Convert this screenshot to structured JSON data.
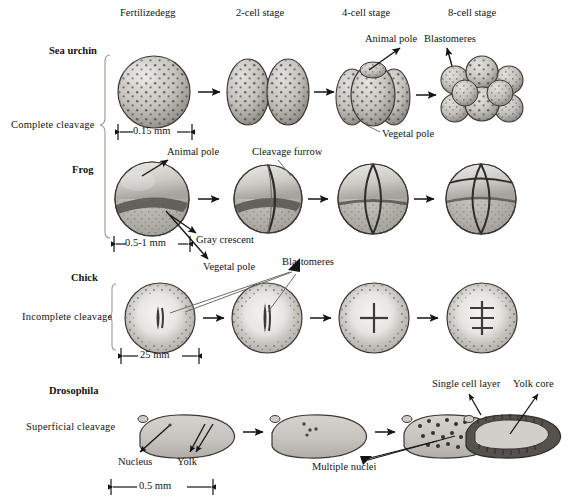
{
  "figure": {
    "columns": [
      {
        "label": "Fertilizedegg",
        "x": 120,
        "y": 14
      },
      {
        "label": "2-cell stage",
        "x": 236,
        "y": 14
      },
      {
        "label": "4-cell stage",
        "x": 342,
        "y": 14
      },
      {
        "label": "8-cell stage",
        "x": 448,
        "y": 14
      }
    ],
    "rows": [
      {
        "name": "Sea urchin",
        "name_x": 100,
        "name_y": 52,
        "cleavage": "Complete cleavage",
        "cleavage_x": 92,
        "cleavage_y": 126
      },
      {
        "name": "Frog",
        "name_x": 100,
        "name_y": 170,
        "cleavage": "",
        "cleavage_x": 0,
        "cleavage_y": 0
      },
      {
        "name": "Chick",
        "name_x": 100,
        "name_y": 278,
        "cleavage": "Incomplete cleavage",
        "cleavage_x": 100,
        "cleavage_y": 316
      },
      {
        "name": "Drosophila",
        "name_x": 100,
        "name_y": 391,
        "cleavage": "Superficial cleavage",
        "cleavage_x": 100,
        "cleavage_y": 427
      }
    ],
    "annotations": [
      {
        "text": "Animal pole",
        "x": 365,
        "y": 40,
        "name": "annotation-animal-pole-urchin"
      },
      {
        "text": "Blastomeres",
        "x": 425,
        "y": 40,
        "name": "annotation-blastomeres-urchin"
      },
      {
        "text": "Vegetal pole",
        "x": 369,
        "y": 135,
        "name": "annotation-vegetal-pole-urchin"
      },
      {
        "text": "Animal pole",
        "x": 168,
        "y": 152,
        "name": "annotation-animal-pole-frog"
      },
      {
        "text": "Cleavage furrow",
        "x": 253,
        "y": 152,
        "name": "annotation-cleavage-furrow"
      },
      {
        "text": "Gray crescent",
        "x": 189,
        "y": 240,
        "name": "annotation-gray-crescent"
      },
      {
        "text": "Vegetal pole",
        "x": 196,
        "y": 267,
        "name": "annotation-vegetal-pole-frog"
      },
      {
        "text": "Blastomeres",
        "x": 283,
        "y": 262,
        "name": "annotation-blastomeres-chick"
      },
      {
        "text": "Nucleus",
        "x": 122,
        "y": 463,
        "name": "annotation-nucleus"
      },
      {
        "text": "Yolk",
        "x": 179,
        "y": 463,
        "name": "annotation-yolk"
      },
      {
        "text": "Multiple nuclei",
        "x": 314,
        "y": 467,
        "name": "annotation-multiple-nuclei"
      },
      {
        "text": "Single cell layer",
        "x": 434,
        "y": 384,
        "name": "annotation-single-cell-layer"
      },
      {
        "text": "Yolk core",
        "x": 515,
        "y": 384,
        "name": "annotation-yolk-core"
      }
    ],
    "scale_bars": [
      {
        "label": "0.15 mm",
        "x1": 118,
        "x2": 192,
        "y": 131,
        "name": "scale-bar-sea-urchin"
      },
      {
        "label": "0.5-1 mm",
        "x1": 114,
        "x2": 190,
        "y": 243,
        "name": "scale-bar-frog"
      },
      {
        "label": "25 mm",
        "x1": 121,
        "x2": 199,
        "y": 356,
        "name": "scale-bar-chick"
      },
      {
        "label": "0.5 mm",
        "x1": 111,
        "x2": 213,
        "y": 487,
        "name": "scale-bar-drosophila"
      }
    ],
    "colors": {
      "ink": "#141414",
      "cell_light": "#d8d6d2",
      "cell_mid": "#b9b6b1",
      "cell_dark": "#8e8b86",
      "speckle": "#4a4744",
      "crescent": "#5d5a56",
      "yolk": "#cfccc7",
      "outline": "#3a3834"
    }
  }
}
